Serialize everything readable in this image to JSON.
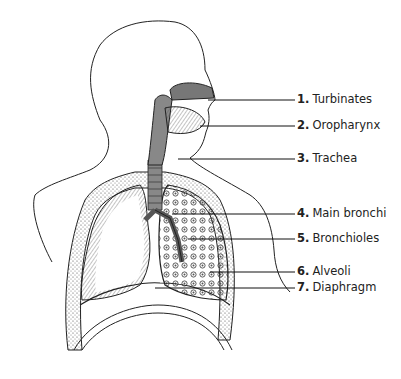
{
  "figure": {
    "labels": [
      {
        "number": "1.",
        "text": "Turbinates",
        "x": 297,
        "y": 93,
        "lineY": 100,
        "lineX1": 208
      },
      {
        "number": "2.",
        "text": "Oropharynx",
        "x": 297,
        "y": 119,
        "lineY": 126,
        "lineX1": 200
      },
      {
        "number": "3.",
        "text": "Trachea",
        "x": 297,
        "y": 152,
        "lineY": 159,
        "lineX1": 178
      },
      {
        "number": "4.",
        "text": "Main bronchi",
        "x": 297,
        "y": 207,
        "lineY": 214,
        "lineX1": 172
      },
      {
        "number": "5.",
        "text": "Bronchioles",
        "x": 297,
        "y": 232,
        "lineY": 239,
        "lineX1": 188
      },
      {
        "number": "6.",
        "text": "Alveoli",
        "x": 297,
        "y": 265,
        "lineY": 272,
        "lineX1": 210
      },
      {
        "number": "7.",
        "text": "Diaphragm",
        "x": 297,
        "y": 281,
        "lineY": 288,
        "lineX1": 155
      }
    ]
  }
}
